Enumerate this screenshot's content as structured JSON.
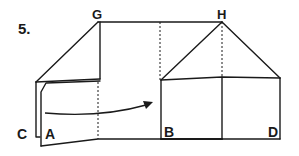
{
  "step": {
    "number": "5."
  },
  "labels": {
    "G": "G",
    "H": "H",
    "A": "A",
    "B": "B",
    "C": "C",
    "D": "D"
  },
  "colors": {
    "stroke": "#1a1a1a",
    "background": "#ffffff"
  },
  "diagram": {
    "arrow": {
      "from": "left flap",
      "to": "B"
    }
  }
}
